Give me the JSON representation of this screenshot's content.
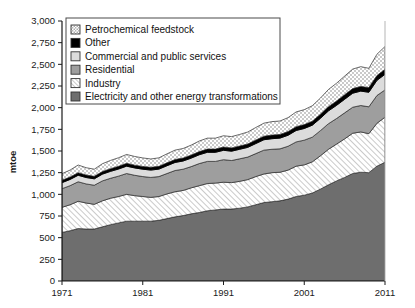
{
  "chart_data": {
    "type": "area",
    "title": "",
    "xlabel": "",
    "ylabel": "mtoe",
    "ylim": [
      0,
      3000
    ],
    "xlim": [
      1971,
      2011
    ],
    "grid": false,
    "legend_position": "top-left",
    "ytick_labels": [
      "0",
      "250",
      "500",
      "750",
      "1,000",
      "1,250",
      "1,500",
      "1,750",
      "2,000",
      "2,250",
      "2,500",
      "2,750",
      "3,000"
    ],
    "ytick_values": [
      0,
      250,
      500,
      750,
      1000,
      1250,
      1500,
      1750,
      2000,
      2250,
      2500,
      2750,
      3000
    ],
    "xtick_labels": [
      "1971",
      "1981",
      "1991",
      "2001",
      "2011"
    ],
    "xtick_values": [
      1971,
      1981,
      1991,
      2001,
      2011
    ],
    "x": [
      1971,
      1972,
      1973,
      1974,
      1975,
      1976,
      1977,
      1978,
      1979,
      1980,
      1981,
      1982,
      1983,
      1984,
      1985,
      1986,
      1987,
      1988,
      1989,
      1990,
      1991,
      1992,
      1993,
      1994,
      1995,
      1996,
      1997,
      1998,
      1999,
      2000,
      2001,
      2002,
      2003,
      2004,
      2005,
      2006,
      2007,
      2008,
      2009,
      2010,
      2011
    ],
    "stack_order_bottom_to_top": [
      "Electricity and other energy transformations",
      "Industry",
      "Residential",
      "Commercial and public services",
      "Other",
      "Petrochemical feedstock"
    ],
    "series": [
      {
        "name": "Electricity and other energy transformations",
        "fill": "#6e6e6e",
        "pattern": "solid-dark-gray",
        "values": [
          560,
          580,
          605,
          600,
          600,
          625,
          650,
          670,
          690,
          690,
          690,
          690,
          700,
          720,
          740,
          755,
          775,
          790,
          810,
          820,
          830,
          830,
          840,
          855,
          880,
          905,
          915,
          925,
          945,
          975,
          990,
          1015,
          1060,
          1110,
          1155,
          1195,
          1240,
          1255,
          1250,
          1325,
          1370
        ]
      },
      {
        "name": "Industry",
        "fill": "#ffffff",
        "pattern": "diagonal-hatch",
        "values": [
          290,
          300,
          315,
          300,
          285,
          300,
          305,
          305,
          310,
          295,
          285,
          275,
          275,
          285,
          290,
          290,
          300,
          310,
          315,
          310,
          310,
          305,
          310,
          315,
          325,
          330,
          335,
          330,
          335,
          350,
          350,
          360,
          385,
          410,
          425,
          445,
          465,
          465,
          450,
          495,
          520
        ]
      },
      {
        "name": "Residential",
        "fill": "#9e9e9e",
        "pattern": "solid-mid-gray",
        "values": [
          215,
          220,
          225,
          220,
          220,
          230,
          230,
          235,
          240,
          235,
          230,
          230,
          230,
          235,
          245,
          245,
          245,
          255,
          255,
          250,
          260,
          255,
          260,
          260,
          265,
          275,
          270,
          270,
          275,
          280,
          285,
          285,
          290,
          295,
          295,
          300,
          300,
          305,
          310,
          320,
          315
        ]
      },
      {
        "name": "Commercial and public services",
        "fill": "#dcdcdc",
        "pattern": "solid-light-gray",
        "values": [
          70,
          72,
          75,
          74,
          74,
          78,
          80,
          82,
          85,
          85,
          85,
          85,
          86,
          90,
          93,
          95,
          98,
          102,
          105,
          105,
          108,
          108,
          110,
          112,
          116,
          120,
          122,
          124,
          127,
          132,
          135,
          138,
          142,
          148,
          152,
          157,
          162,
          166,
          168,
          175,
          180
        ]
      },
      {
        "name": "Other",
        "fill": "#000000",
        "pattern": "solid-black",
        "values": [
          28,
          28,
          30,
          29,
          29,
          30,
          31,
          32,
          33,
          32,
          32,
          32,
          32,
          33,
          34,
          34,
          35,
          36,
          37,
          37,
          38,
          38,
          38,
          39,
          40,
          41,
          42,
          42,
          43,
          44,
          45,
          46,
          47,
          49,
          50,
          52,
          53,
          54,
          54,
          56,
          58
        ]
      },
      {
        "name": "Petrochemical feedstock",
        "fill": "#ffffff",
        "pattern": "dotted",
        "values": [
          75,
          80,
          88,
          84,
          82,
          90,
          95,
          98,
          102,
          100,
          98,
          96,
          98,
          104,
          108,
          110,
          115,
          122,
          126,
          126,
          130,
          130,
          133,
          138,
          145,
          150,
          155,
          155,
          160,
          170,
          172,
          178,
          186,
          198,
          205,
          215,
          225,
          228,
          222,
          245,
          262
        ]
      }
    ],
    "totals_endpoints": {
      "1971": 1238,
      "2011": 2705
    }
  },
  "legend": {
    "items": [
      {
        "label": "Petrochemical feedstock",
        "swatch": "dotted"
      },
      {
        "label": "Other",
        "swatch": "solid-black"
      },
      {
        "label": "Commercial and public services",
        "swatch": "solid-light-gray"
      },
      {
        "label": "Residential",
        "swatch": "solid-mid-gray"
      },
      {
        "label": "Industry",
        "swatch": "diagonal-hatch"
      },
      {
        "label": "Electricity and other energy transformations",
        "swatch": "solid-dark-gray"
      }
    ]
  },
  "colors": {
    "electricity": "#6e6e6e",
    "industry": "#ffffff",
    "residential": "#9e9e9e",
    "commercial": "#dcdcdc",
    "other": "#000000",
    "petrochemical": "#ffffff",
    "axis": "#1a1a1a",
    "background": "#ffffff"
  }
}
